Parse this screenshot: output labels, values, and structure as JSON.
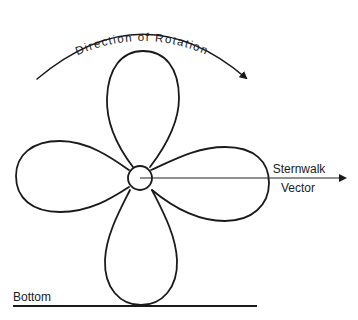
{
  "diagram": {
    "type": "propeller-sternwalk",
    "rotation_label": "Direction of Rotation",
    "vector_label_line1": "Sternwalk",
    "vector_label_line2": "Vector",
    "bottom_label": "Bottom",
    "blade_count": 4,
    "colors": {
      "stroke": "#1a1a1a",
      "background": "#ffffff"
    }
  }
}
